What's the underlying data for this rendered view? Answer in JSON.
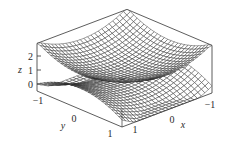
{
  "chart_data": {
    "type": "surface3d",
    "title": "",
    "xlabel": "x",
    "ylabel": "y",
    "zlabel": "z",
    "x_range": [
      -1,
      1
    ],
    "y_range": [
      -1,
      1
    ],
    "z_range": [
      -0.5,
      2.9
    ],
    "x_ticks": [
      "-1",
      "0",
      "1"
    ],
    "y_ticks": [
      "-1",
      "0",
      "1"
    ],
    "z_ticks": [
      "0",
      "1",
      "2"
    ],
    "grid": false,
    "legend": null,
    "series": [
      {
        "name": "upper surface (paraboloid)",
        "expression": "z = 1 + x^2 + y^2",
        "mesh": 25
      },
      {
        "name": "lower surface (saddle)",
        "expression": "z = x^2 - y^2",
        "mesh": 25
      }
    ]
  },
  "axes": {
    "x_label": "x",
    "y_label": "y",
    "z_label": "z",
    "x_tick_labels": [
      "−1",
      "0",
      "1"
    ],
    "y_tick_labels": [
      "−1",
      "0",
      "1"
    ],
    "z_tick_labels": [
      "0",
      "1",
      "2"
    ]
  }
}
